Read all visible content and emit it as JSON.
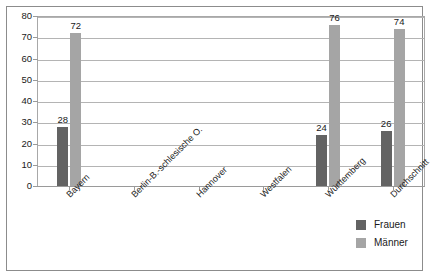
{
  "chart_data": {
    "type": "bar",
    "title": "",
    "subtitle": "",
    "xlabel": "",
    "ylabel": "",
    "ylim": [
      0,
      80
    ],
    "ytick_labels": [
      "0",
      "10",
      "20",
      "30",
      "40",
      "50",
      "60",
      "70",
      "80"
    ],
    "ytick_values": [
      0,
      10,
      20,
      30,
      40,
      50,
      60,
      70,
      80
    ],
    "grid": true,
    "legend_position": "bottom-right",
    "categories": [
      "Bayern",
      "Berlin-B.-schlesische O.",
      "Hannover",
      "Westfalen",
      "Württemberg",
      "Durchschnitt"
    ],
    "series": [
      {
        "name": "Frauen",
        "color": "#636363",
        "values": [
          28,
          null,
          null,
          null,
          24,
          26
        ],
        "labels": [
          "28",
          "",
          "",
          "",
          "24",
          "26"
        ]
      },
      {
        "name": "Männer",
        "color": "#a5a5a5",
        "values": [
          72,
          null,
          null,
          null,
          76,
          74
        ],
        "labels": [
          "72",
          "",
          "",
          "",
          "76",
          "74"
        ]
      }
    ]
  },
  "legend": {
    "items": [
      {
        "label": "Frauen",
        "color": "#636363"
      },
      {
        "label": "Männer",
        "color": "#a5a5a5"
      }
    ]
  },
  "colors": {
    "frauen": "#636363",
    "maenner": "#a5a5a5",
    "grid": "#b4b4b4",
    "axis": "#9a9a9a",
    "frame": "#8c8c8c",
    "text": "#1a1a1a",
    "background": "#ffffff"
  }
}
